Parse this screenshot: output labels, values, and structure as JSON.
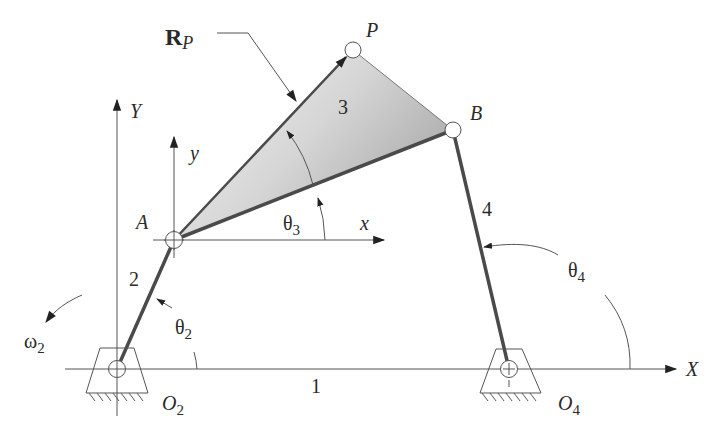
{
  "diagram": {
    "colors": {
      "background": "#ffffff",
      "link": "#4a4a4a",
      "thin_line": "#555555",
      "coupler_fill_light": "#f2f2f2",
      "coupler_fill_dark": "#b8b8b8",
      "pin_fill": "#ffffff"
    },
    "points": {
      "O2": {
        "x": 117,
        "y": 369
      },
      "A": {
        "x": 174,
        "y": 240
      },
      "B": {
        "x": 453,
        "y": 130
      },
      "P": {
        "x": 353,
        "y": 50
      },
      "O4": {
        "x": 509,
        "y": 369
      }
    },
    "labels": {
      "R_bold": "R",
      "R_sub": "P",
      "P": "P",
      "B": "B",
      "A": "A",
      "Y": "Y",
      "y": "y",
      "x": "x",
      "X": "X",
      "link1": "1",
      "link2": "2",
      "link3": "3",
      "link4": "4",
      "theta": "θ",
      "theta2_sub": "2",
      "theta3_sub": "3",
      "theta4_sub": "4",
      "omega": "ω",
      "omega2_sub": "2",
      "O": "O",
      "O2_sub": "2",
      "O4_sub": "4"
    },
    "icons": [
      "ground-pivot-icon",
      "pin-joint-icon",
      "arrowhead-icon"
    ]
  }
}
